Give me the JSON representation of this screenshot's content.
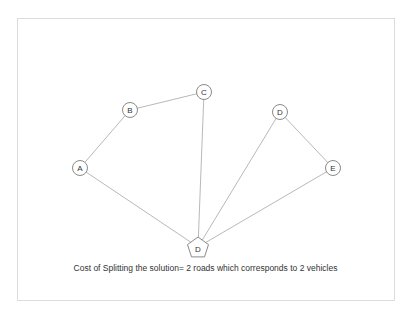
{
  "diagram": {
    "caption": "Cost of Splitting the solution= 2 roads which corresponds to 2 vehicles",
    "nodes": [
      {
        "id": "A",
        "label": "A",
        "x": 80,
        "y": 168,
        "shape": "circle"
      },
      {
        "id": "B",
        "label": "B",
        "x": 130,
        "y": 110,
        "shape": "circle"
      },
      {
        "id": "C",
        "label": "C",
        "x": 204,
        "y": 92,
        "shape": "circle"
      },
      {
        "id": "D1",
        "label": "D",
        "x": 280,
        "y": 112,
        "shape": "circle"
      },
      {
        "id": "E",
        "label": "E",
        "x": 333,
        "y": 168,
        "shape": "circle"
      },
      {
        "id": "depot",
        "label": "D",
        "x": 198,
        "y": 247,
        "shape": "pentagon"
      }
    ],
    "edges": [
      [
        "depot",
        "A"
      ],
      [
        "A",
        "B"
      ],
      [
        "B",
        "C"
      ],
      [
        "C",
        "depot"
      ],
      [
        "depot",
        "D1"
      ],
      [
        "D1",
        "E"
      ],
      [
        "E",
        "depot"
      ]
    ],
    "colors": {
      "edge": "#b9b9b9",
      "node_stroke": "#8a8a8a",
      "frame": "#dcdcdc"
    }
  }
}
